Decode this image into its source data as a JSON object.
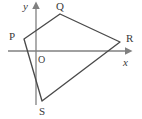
{
  "figure": {
    "type": "geometry-diagram",
    "background_color": "#ffffff",
    "stroke_color": "#4a4a4a",
    "axis_color": "#808080",
    "label_color": "#3a3a3a",
    "width": 142,
    "height": 119
  },
  "axes": {
    "x_axis": {
      "label": "x",
      "label_x": 123,
      "label_y": 57,
      "line_x1": 8,
      "line_y1": 51,
      "line_x2": 126,
      "line_y2": 51,
      "arrow": "right"
    },
    "y_axis": {
      "label": "y",
      "label_x": 23,
      "label_y": 1,
      "line_x1": 36,
      "line_y1": 105,
      "line_x2": 36,
      "line_y2": 8,
      "arrow": "up"
    },
    "origin": {
      "label": "O",
      "label_x": 38,
      "label_y": 55,
      "x": 36,
      "y": 51
    }
  },
  "polygon": {
    "name": "PQRS",
    "points": "24,39 60,14 120,42 42,101",
    "vertices": [
      {
        "id": "P",
        "label": "P",
        "x": 24,
        "y": 39,
        "label_x": 9,
        "label_y": 31
      },
      {
        "id": "Q",
        "label": "Q",
        "x": 60,
        "y": 14,
        "label_x": 56,
        "label_y": 1
      },
      {
        "id": "R",
        "label": "R",
        "x": 120,
        "y": 42,
        "label_x": 126,
        "label_y": 33
      },
      {
        "id": "S",
        "label": "S",
        "x": 42,
        "y": 101,
        "label_x": 39,
        "label_y": 106
      }
    ],
    "edges": [
      {
        "from": "P",
        "to": "Q"
      },
      {
        "from": "Q",
        "to": "R"
      },
      {
        "from": "R",
        "to": "S"
      },
      {
        "from": "S",
        "to": "P"
      }
    ]
  }
}
